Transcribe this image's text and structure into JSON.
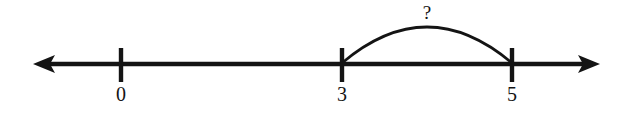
{
  "figure": {
    "type": "number-line-diagram",
    "width": 629,
    "height": 113,
    "background_color": "#ffffff",
    "ink_color": "#141414"
  },
  "axis": {
    "name": "number-line",
    "y": 64,
    "left_arrow_tip_x": 33,
    "right_arrow_tip_x": 600,
    "thickness": 4,
    "left_arrowhead": "arrow-left",
    "right_arrowhead": "arrow-right"
  },
  "ticks": [
    {
      "label": "0",
      "x": 121,
      "top": 48,
      "bottom": 82,
      "label_y": 84
    },
    {
      "label": "3",
      "x": 342,
      "top": 48,
      "bottom": 82,
      "label_y": 84
    },
    {
      "label": "5",
      "x": 512,
      "top": 48,
      "bottom": 82,
      "label_y": 84
    }
  ],
  "arc": {
    "name": "span-arc-3-to-5",
    "start_x": 342,
    "end_x": 512,
    "baseline_y": 63,
    "peak_x": 428,
    "peak_y": 26,
    "label": "?",
    "label_x": 427,
    "label_y": 3,
    "stroke_width": 2.6
  }
}
